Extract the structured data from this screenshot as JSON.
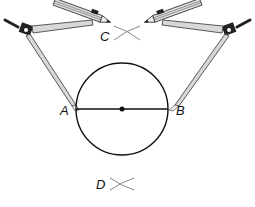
{
  "diagram": {
    "labels": {
      "A": "A",
      "B": "B",
      "C": "C",
      "D": "D"
    },
    "circle": {
      "cx": 122,
      "cy": 109,
      "r": 46
    },
    "diameter": {
      "from": "A",
      "to": "B"
    },
    "arc_intersections": [
      "C",
      "D"
    ],
    "colors": {
      "line": "#111111",
      "arc": "#888888",
      "compass_metal": "#cfcfcf",
      "compass_dark": "#222222"
    }
  }
}
